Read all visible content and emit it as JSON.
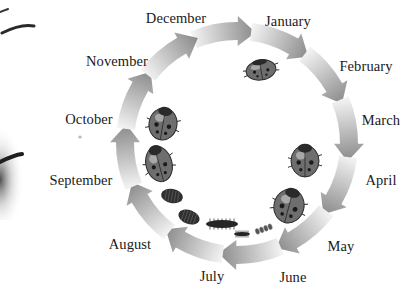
{
  "diagram": {
    "type": "circular-cycle",
    "center": [
      237,
      143
    ],
    "radius": 112,
    "direction": "clockwise",
    "arrow_color_light": "#f2f2f2",
    "arrow_color_dark": "#8a8a8a",
    "months": [
      {
        "label": "December",
        "x": 176,
        "y": 18
      },
      {
        "label": "January",
        "x": 288,
        "y": 21
      },
      {
        "label": "February",
        "x": 366,
        "y": 66
      },
      {
        "label": "March",
        "x": 381,
        "y": 120
      },
      {
        "label": "April",
        "x": 381,
        "y": 180
      },
      {
        "label": "May",
        "x": 341,
        "y": 246
      },
      {
        "label": "June",
        "x": 293,
        "y": 277
      },
      {
        "label": "July",
        "x": 212,
        "y": 276
      },
      {
        "label": "August",
        "x": 130,
        "y": 244
      },
      {
        "label": "September",
        "x": 81,
        "y": 180
      },
      {
        "label": "October",
        "x": 89,
        "y": 119
      },
      {
        "label": "November",
        "x": 117,
        "y": 61
      }
    ],
    "stages": [
      {
        "name": "adult-overwintering",
        "x": 261,
        "y": 70,
        "w": 30,
        "h": 20,
        "rot": -10,
        "kind": "adult"
      },
      {
        "name": "adult-spring",
        "x": 305,
        "y": 161,
        "w": 28,
        "h": 32,
        "rot": 0,
        "kind": "adult"
      },
      {
        "name": "adult-mating",
        "x": 289,
        "y": 206,
        "w": 30,
        "h": 34,
        "rot": 15,
        "kind": "adult"
      },
      {
        "name": "eggs",
        "x": 264,
        "y": 229,
        "w": 18,
        "h": 6,
        "rot": -20,
        "kind": "eggs"
      },
      {
        "name": "larva-small",
        "x": 242,
        "y": 234,
        "w": 16,
        "h": 4,
        "rot": 0,
        "kind": "larva"
      },
      {
        "name": "larva-large",
        "x": 222,
        "y": 224,
        "w": 32,
        "h": 8,
        "rot": 0,
        "kind": "larva"
      },
      {
        "name": "pupa-1",
        "x": 189,
        "y": 217,
        "w": 22,
        "h": 14,
        "rot": 20,
        "kind": "pupa"
      },
      {
        "name": "pupa-2",
        "x": 172,
        "y": 196,
        "w": 22,
        "h": 14,
        "rot": 10,
        "kind": "pupa"
      },
      {
        "name": "adult-emerging",
        "x": 159,
        "y": 164,
        "w": 26,
        "h": 36,
        "rot": -15,
        "kind": "adult"
      },
      {
        "name": "adult-autumn",
        "x": 163,
        "y": 124,
        "w": 28,
        "h": 32,
        "rot": 10,
        "kind": "adult"
      }
    ]
  }
}
